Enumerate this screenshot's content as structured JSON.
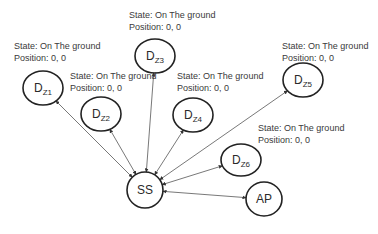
{
  "diagram": {
    "nodes": [
      {
        "id": "dz1",
        "main": "D",
        "sub": "Z1",
        "cx": 43,
        "cy": 88,
        "rx": 20,
        "ry": 17
      },
      {
        "id": "dz2",
        "main": "D",
        "sub": "Z2",
        "cx": 101,
        "cy": 114,
        "rx": 20,
        "ry": 17
      },
      {
        "id": "dz3",
        "main": "D",
        "sub": "Z3",
        "cx": 155,
        "cy": 56,
        "rx": 20,
        "ry": 17
      },
      {
        "id": "dz4",
        "main": "D",
        "sub": "Z4",
        "cx": 193,
        "cy": 115,
        "rx": 20,
        "ry": 17
      },
      {
        "id": "dz5",
        "main": "D",
        "sub": "Z5",
        "cx": 303,
        "cy": 80,
        "rx": 20,
        "ry": 17
      },
      {
        "id": "dz6",
        "main": "D",
        "sub": "Z6",
        "cx": 241,
        "cy": 160,
        "rx": 20,
        "ry": 16
      },
      {
        "id": "ss",
        "main": "SS",
        "sub": "",
        "cx": 145,
        "cy": 190,
        "rx": 18,
        "ry": 18
      },
      {
        "id": "ap",
        "main": "AP",
        "sub": "",
        "cx": 264,
        "cy": 199,
        "rx": 18,
        "ry": 17
      }
    ],
    "labels": [
      {
        "node": "dz1",
        "state": "State: On The ground",
        "position": "Position: 0, 0",
        "x": 14,
        "y": 40
      },
      {
        "node": "dz2",
        "state": "State: On The ground",
        "position": "Position: 0, 0",
        "x": 70,
        "y": 70
      },
      {
        "node": "dz3",
        "state": "State: On The ground",
        "position": "Position: 0, 0",
        "x": 129,
        "y": 9
      },
      {
        "node": "dz4",
        "state": "State: On The ground",
        "position": "Position: 0, 0",
        "x": 177,
        "y": 70
      },
      {
        "node": "dz5",
        "state": "State: On The ground",
        "position": "Position: 0, 0",
        "x": 282,
        "y": 40
      },
      {
        "node": "dz6",
        "state": "State: On The ground",
        "position": "Position: 0, 0",
        "x": 258,
        "y": 122
      }
    ],
    "edges": [
      {
        "from": "ss",
        "to": "dz1",
        "bidirectional": true
      },
      {
        "from": "ss",
        "to": "dz2",
        "bidirectional": true
      },
      {
        "from": "ss",
        "to": "dz3",
        "bidirectional": true
      },
      {
        "from": "ss",
        "to": "dz4",
        "bidirectional": true
      },
      {
        "from": "ss",
        "to": "dz5",
        "bidirectional": true
      },
      {
        "from": "ss",
        "to": "dz6",
        "bidirectional": true
      },
      {
        "from": "ss",
        "to": "ap",
        "bidirectional": true
      }
    ],
    "colors": {
      "stroke": "#222222",
      "edge": "#555555",
      "text": "#3a3a3a"
    }
  }
}
